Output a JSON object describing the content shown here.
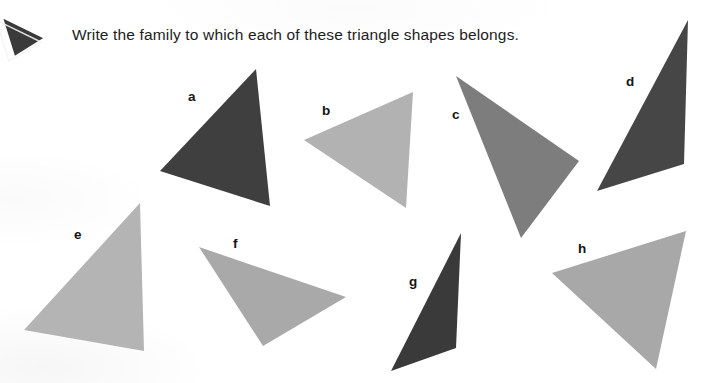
{
  "worksheet": {
    "prompt": "Write the family to which each of these triangle shapes belongs.",
    "background_color": "#ffffff",
    "text_color": "#1d1d1d",
    "bullet_icon": {
      "name": "triangle-bullet-icon",
      "fill": "#3a3a3a",
      "outline": "#ffffff"
    },
    "labels": [
      {
        "id": "a",
        "text": "a",
        "x": 188,
        "y": 90
      },
      {
        "id": "b",
        "text": "b",
        "x": 322,
        "y": 104
      },
      {
        "id": "c",
        "text": "c",
        "x": 452,
        "y": 108
      },
      {
        "id": "d",
        "text": "d",
        "x": 626,
        "y": 75
      },
      {
        "id": "e",
        "text": "e",
        "x": 74,
        "y": 228
      },
      {
        "id": "f",
        "text": "f",
        "x": 233,
        "y": 237
      },
      {
        "id": "g",
        "text": "g",
        "x": 409,
        "y": 275
      },
      {
        "id": "h",
        "text": "h",
        "x": 578,
        "y": 242
      }
    ],
    "shapes": [
      {
        "id": "a",
        "name": "triangle-a",
        "fill": "#3f3f3f",
        "points": "256,69 160,171 270,206",
        "family": ""
      },
      {
        "id": "b",
        "name": "triangle-b",
        "fill": "#b2b2b2",
        "points": "413,92 304,140 406,208",
        "family": ""
      },
      {
        "id": "c",
        "name": "triangle-c",
        "fill": "#7d7d7d",
        "points": "456,76 579,161 521,238",
        "family": ""
      },
      {
        "id": "d",
        "name": "triangle-d",
        "fill": "#464646",
        "points": "688,20 684,164 597,191",
        "family": ""
      },
      {
        "id": "e",
        "name": "triangle-e",
        "fill": "#b4b4b4",
        "points": "140,203 24,330 144,351",
        "family": ""
      },
      {
        "id": "f",
        "name": "triangle-f",
        "fill": "#a9a9a9",
        "points": "199,247 346,297 263,346",
        "family": ""
      },
      {
        "id": "g",
        "name": "triangle-g",
        "fill": "#3a3a3a",
        "points": "461,233 456,348 391,371",
        "family": ""
      },
      {
        "id": "h",
        "name": "triangle-h",
        "fill": "#a8a8a8",
        "points": "686,231 552,273 656,369",
        "family": ""
      }
    ]
  }
}
